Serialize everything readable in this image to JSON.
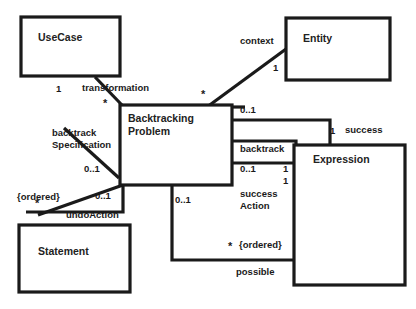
{
  "diagram": {
    "kind": "uml-class-diagram",
    "background_color": "#ffffff",
    "line_color": "#1a1a1a",
    "text_color": "#1a1a1a",
    "classes": [
      {
        "id": "usecase",
        "name": "UseCase"
      },
      {
        "id": "entity",
        "name": "Entity"
      },
      {
        "id": "backtrackingproblem",
        "name_line1": "Backtracking",
        "name_line2": "Problem"
      },
      {
        "id": "expression",
        "name": "Expression"
      },
      {
        "id": "statement",
        "name": "Statement"
      }
    ],
    "associations": [
      {
        "id": "transformation",
        "from": "usecase",
        "to": "backtrackingproblem",
        "role": "transformation",
        "source_multiplicity": "1",
        "target_multiplicity": "*"
      },
      {
        "id": "backtrack-specification",
        "from": "usecase",
        "to": "backtrackingproblem",
        "role_line1": "backtrack",
        "role_line2": "Specification",
        "target_multiplicity": "0..1"
      },
      {
        "id": "context",
        "from": "backtrackingproblem",
        "to": "entity",
        "role": "context",
        "target_multiplicity": "1",
        "source_multiplicity": "*"
      },
      {
        "id": "success",
        "from": "backtrackingproblem",
        "to": "expression",
        "role": "success",
        "source_multiplicity": "0..1",
        "target_multiplicity": "1"
      },
      {
        "id": "backtrack",
        "from": "backtrackingproblem",
        "to": "expression",
        "role": "backtrack",
        "source_multiplicity": "0..1",
        "target_multiplicity": "1"
      },
      {
        "id": "success-action",
        "from": "backtrackingproblem",
        "to": "expression",
        "role_line1": "success",
        "role_line2": "Action",
        "target_multiplicity": "1"
      },
      {
        "id": "possible",
        "from": "backtrackingproblem",
        "to": "expression",
        "role": "possible",
        "source_multiplicity": "0..1",
        "target_multiplicity": "*",
        "constraint": "{ordered}"
      },
      {
        "id": "undo-action",
        "from": "backtrackingproblem",
        "to": "statement",
        "role": "undoAction",
        "source_multiplicity": "0..1",
        "target_multiplicity": "*",
        "constraint": "{ordered}"
      }
    ],
    "labels": {
      "transformation": "transformation",
      "context": "context",
      "backtrack_spec_line1": "backtrack",
      "backtrack_spec_line2": "Specification",
      "success": "success",
      "backtrack": "backtrack",
      "success_action_line1": "success",
      "success_action_line2": "Action",
      "possible": "possible",
      "undo_action": "undoAction",
      "ordered_left": "{ordered}",
      "ordered_right": "{ordered}",
      "mult_usecase_one": "1",
      "mult_transformation_star": "*",
      "mult_backtrackspec_01": "0..1",
      "mult_context_star": "*",
      "mult_entity_one": "1",
      "mult_success_01": "0..1",
      "mult_success_one": "1",
      "mult_backtrack_01": "0..1",
      "mult_backtrack_one": "1",
      "mult_successaction_one": "1",
      "mult_possible_01": "0..1",
      "mult_possible_star": "*",
      "mult_undo_01": "0..1",
      "mult_undo_star": "*"
    }
  }
}
